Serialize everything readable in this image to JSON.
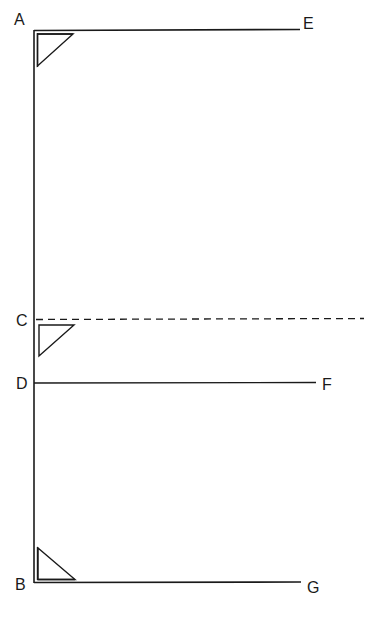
{
  "diagram": {
    "title": "",
    "colors": {
      "stroke": "#1a1a1a",
      "background": "#ffffff"
    },
    "points": {
      "A": {
        "label": "A",
        "x": 14,
        "y": 25
      },
      "E": {
        "label": "E",
        "x": 304,
        "y": 29
      },
      "C": {
        "label": "C",
        "x": 14,
        "y": 326
      },
      "D": {
        "label": "D",
        "x": 14,
        "y": 389
      },
      "F": {
        "label": "F",
        "x": 323,
        "y": 390
      },
      "B": {
        "label": "B",
        "x": 14,
        "y": 590
      },
      "G": {
        "label": "G",
        "x": 308,
        "y": 593
      }
    },
    "segments": [
      {
        "id": "AB",
        "from": "A",
        "to": "B",
        "style": "solid",
        "note": "vertical double line"
      },
      {
        "id": "AE",
        "from": "A",
        "to": "E",
        "style": "solid"
      },
      {
        "id": "C-ray",
        "from": "C",
        "to": "right edge",
        "style": "dashed"
      },
      {
        "id": "DF",
        "from": "D",
        "to": "F",
        "style": "solid"
      },
      {
        "id": "BG",
        "from": "B",
        "to": "G",
        "style": "solid"
      }
    ],
    "triangles": [
      {
        "id": "triangle-top",
        "position": "below A",
        "orientation": "right angle top-left"
      },
      {
        "id": "triangle-middle",
        "position": "below C",
        "orientation": "right angle top-left"
      },
      {
        "id": "triangle-bottom",
        "position": "above B",
        "orientation": "right angle bottom-left"
      }
    ]
  }
}
